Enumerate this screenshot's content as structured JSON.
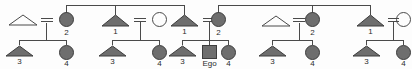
{
  "diagram": {
    "type": "pedigree",
    "width": 412,
    "height": 69,
    "colors": {
      "line": "#4a4a4a",
      "fill_affected": "#6e6e6e",
      "stroke": "#3d3d3d",
      "background": "#fdfdfd",
      "text": "#2b2b2b"
    },
    "legend": {
      "triangle": "male",
      "circle": "female",
      "square": "ego",
      "filled": "affected",
      "open": "unaffected",
      "double_line": "marriage-union"
    }
  },
  "families": [
    {
      "id": "family-1",
      "parents": [
        {
          "symbol": "triangle",
          "state": "open",
          "label": ""
        },
        {
          "symbol": "circle",
          "state": "filled",
          "label": "2"
        }
      ],
      "children": [
        {
          "symbol": "triangle",
          "state": "filled",
          "label": "3"
        },
        {
          "symbol": "circle",
          "state": "filled",
          "label": "4"
        }
      ]
    },
    {
      "id": "family-2",
      "parents": [
        {
          "symbol": "triangle",
          "state": "filled",
          "label": "1"
        },
        {
          "symbol": "circle",
          "state": "open",
          "label": ""
        }
      ],
      "children": [
        {
          "symbol": "triangle",
          "state": "filled",
          "label": "3"
        },
        {
          "symbol": "circle",
          "state": "filled",
          "label": "4"
        }
      ]
    },
    {
      "id": "family-3",
      "parents": [
        {
          "symbol": "triangle",
          "state": "filled",
          "label": "1"
        },
        {
          "symbol": "circle",
          "state": "filled",
          "label": "2"
        }
      ],
      "children": [
        {
          "symbol": "triangle",
          "state": "filled",
          "label": "3"
        },
        {
          "symbol": "square",
          "state": "filled",
          "label": "Ego"
        },
        {
          "symbol": "circle",
          "state": "filled",
          "label": "4"
        }
      ]
    },
    {
      "id": "family-4",
      "parents": [
        {
          "symbol": "triangle",
          "state": "open",
          "label": ""
        },
        {
          "symbol": "circle",
          "state": "filled",
          "label": "2"
        }
      ],
      "children": [
        {
          "symbol": "triangle",
          "state": "filled",
          "label": "3"
        },
        {
          "symbol": "circle",
          "state": "filled",
          "label": "4"
        }
      ]
    },
    {
      "id": "family-5",
      "parents": [
        {
          "symbol": "triangle",
          "state": "filled",
          "label": "1"
        },
        {
          "symbol": "circle",
          "state": "open",
          "label": ""
        }
      ],
      "children": [
        {
          "symbol": "triangle",
          "state": "filled",
          "label": "3"
        },
        {
          "symbol": "circle",
          "state": "filled",
          "label": "4"
        }
      ]
    }
  ],
  "labels": {
    "f1_p2": "2",
    "f1_c1": "3",
    "f1_c2": "4",
    "f2_p1": "1",
    "f2_c1": "3",
    "f2_c2": "4",
    "f3_p1": "1",
    "f3_p2": "2",
    "f3_c1": "3",
    "f3_c2": "Ego",
    "f3_c3": "4",
    "f4_p2": "2",
    "f4_c1": "3",
    "f4_c2": "4",
    "f5_p1": "1",
    "f5_c1": "3",
    "f5_c2": "4"
  }
}
